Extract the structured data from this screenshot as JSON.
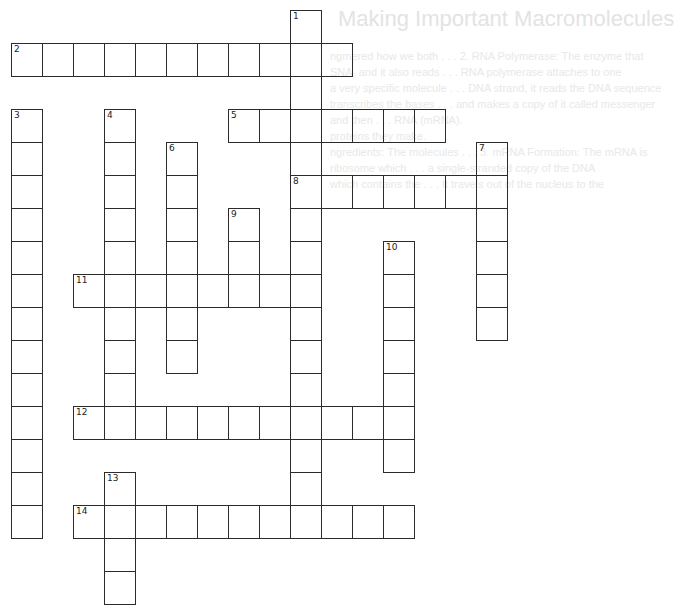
{
  "ghost_text": {
    "title": "Making Important Macromolecules",
    "lines": [
      "ngmered how we both . . .   2. RNA Polymerase: The enzyme that",
      "SNA, and it also reads . . .   RNA polymerase attaches to one",
      "a very specific molecule . . .   DNA strand, it reads the DNA sequence",
      "transcribes the bases . . .   and makes a copy of it called messenger",
      "and then . . .   RNA (mRNA).",
      "proteins they make.",
      "ngredients: The molecules . . .   3. mRNA Formation: The mRNA is",
      "ribosome which . . .   a single-stranded copy of the DNA",
      "which contains the . . .   It travels out of the nucleus to the"
    ]
  },
  "grid": {
    "origin_x": 11,
    "origin_y": 10,
    "cell_w": 31,
    "cell_h": 33,
    "border_color": "#2b2b2b"
  },
  "clues": [
    {
      "number": "1",
      "direction": "down",
      "row": 0,
      "col": 9,
      "length": 16
    },
    {
      "number": "2",
      "direction": "across",
      "row": 1,
      "col": 0,
      "length": 11
    },
    {
      "number": "3",
      "direction": "down",
      "row": 3,
      "col": 0,
      "length": 13
    },
    {
      "number": "4",
      "direction": "down",
      "row": 3,
      "col": 3,
      "length": 10
    },
    {
      "number": "5",
      "direction": "across",
      "row": 3,
      "col": 7,
      "length": 7
    },
    {
      "number": "6",
      "direction": "down",
      "row": 4,
      "col": 5,
      "length": 7
    },
    {
      "number": "7",
      "direction": "down",
      "row": 4,
      "col": 15,
      "length": 6
    },
    {
      "number": "8",
      "direction": "across",
      "row": 5,
      "col": 9,
      "length": 7
    },
    {
      "number": "9",
      "direction": "down",
      "row": 6,
      "col": 7,
      "length": 3
    },
    {
      "number": "10",
      "direction": "down",
      "row": 7,
      "col": 12,
      "length": 7
    },
    {
      "number": "11",
      "direction": "across",
      "row": 8,
      "col": 2,
      "length": 8
    },
    {
      "number": "12",
      "direction": "across",
      "row": 12,
      "col": 2,
      "length": 11
    },
    {
      "number": "13",
      "direction": "down",
      "row": 14,
      "col": 3,
      "length": 4
    },
    {
      "number": "14",
      "direction": "across",
      "row": 15,
      "col": 2,
      "length": 11
    }
  ]
}
